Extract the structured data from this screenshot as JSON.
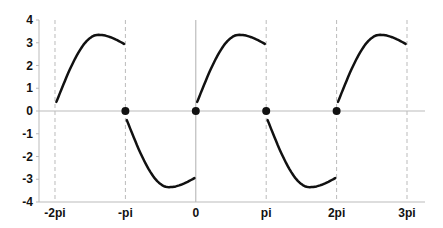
{
  "chart_data": {
    "type": "line",
    "title": "",
    "xlabel": "",
    "ylabel": "",
    "xlim": [
      -6.9,
      10.25
    ],
    "ylim": [
      -4,
      4
    ],
    "grid": "dashed vertical lines at multiples of pi",
    "x_ticks": [
      {
        "value": -6.2832,
        "label": "-2pi"
      },
      {
        "value": -3.1416,
        "label": "-pi"
      },
      {
        "value": 0,
        "label": "0"
      },
      {
        "value": 3.1416,
        "label": "pi"
      },
      {
        "value": 6.2832,
        "label": "2pi"
      },
      {
        "value": 9.4248,
        "label": "3pi"
      }
    ],
    "y_ticks": [
      {
        "value": 4,
        "label": "4"
      },
      {
        "value": 3,
        "label": "3"
      },
      {
        "value": 2,
        "label": "2"
      },
      {
        "value": 1,
        "label": "1"
      },
      {
        "value": 0,
        "label": "0"
      },
      {
        "value": -1,
        "label": "-1"
      },
      {
        "value": -2,
        "label": "-2"
      },
      {
        "value": -3,
        "label": "-3"
      },
      {
        "value": -4,
        "label": "-4"
      }
    ],
    "series": [
      {
        "name": "segment-1",
        "sign": 1,
        "x_start": -6.2832,
        "x_end": -3.1416,
        "start_y": 0.4,
        "peak_y": 3.35,
        "end_y": 2.95
      },
      {
        "name": "segment-2",
        "sign": -1,
        "x_start": -3.1416,
        "x_end": 0,
        "start_y": -0.4,
        "peak_y": -3.35,
        "end_y": -2.95
      },
      {
        "name": "segment-3",
        "sign": 1,
        "x_start": 0,
        "x_end": 3.1416,
        "start_y": 0.4,
        "peak_y": 3.35,
        "end_y": 2.95
      },
      {
        "name": "segment-4",
        "sign": -1,
        "x_start": 3.1416,
        "x_end": 6.2832,
        "start_y": -0.4,
        "peak_y": -3.35,
        "end_y": -2.95
      },
      {
        "name": "segment-5",
        "sign": 1,
        "x_start": 6.2832,
        "x_end": 9.4248,
        "start_y": 0.4,
        "peak_y": 3.35,
        "end_y": 2.95
      }
    ],
    "markers": [
      {
        "x": -3.1416,
        "y": 0
      },
      {
        "x": 0,
        "y": 0
      },
      {
        "x": 3.1416,
        "y": 0
      },
      {
        "x": 6.2832,
        "y": 0
      }
    ],
    "colors": {
      "line": "#111111",
      "marker": "#111111",
      "grid": "#bbbbbb",
      "axis": "#bbbbbb",
      "zero_line": "#bbbbbb"
    }
  }
}
